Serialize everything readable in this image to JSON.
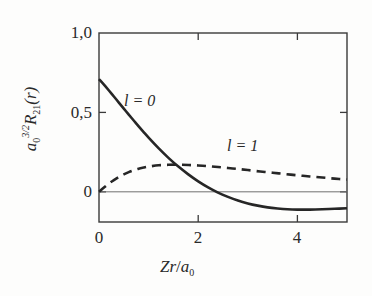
{
  "chart_data": {
    "type": "line",
    "title": "",
    "subtitle": "",
    "xlabel": "Zr/a0",
    "xlabel_parts": {
      "Z": "Z",
      "r": "r",
      "slash": "/",
      "a": "a",
      "sub": "0"
    },
    "ylabel": "a0^(3/2) R21(r)",
    "ylabel_parts": {
      "a": "a",
      "a_sub": "0",
      "a_sup": "3/2",
      "R": "R",
      "R_sub": "21",
      "arg": "(r)"
    },
    "xlim": [
      0,
      5
    ],
    "ylim": [
      -0.19,
      1.0
    ],
    "grid": false,
    "legend_position": "inline-annotations",
    "x_ticks": [
      {
        "value": 0,
        "label": "0"
      },
      {
        "value": 2,
        "label": "2"
      },
      {
        "value": 4,
        "label": "4"
      }
    ],
    "x_minor_ticks": [],
    "y_ticks": [
      {
        "value": 0,
        "label": "0"
      },
      {
        "value": 0.5,
        "label": "0,5"
      },
      {
        "value": 1.0,
        "label": "1,0"
      }
    ],
    "zero_line": {
      "value": 0,
      "visible": true
    },
    "annotations": [
      {
        "name": "l-equals-0",
        "text": "l = 0",
        "x": 0.5,
        "y": 0.64
      },
      {
        "name": "l-equals-1",
        "text": "l = 1",
        "x": 2.6,
        "y": 0.35
      }
    ],
    "series": [
      {
        "name": "l = 0",
        "label": "l = 0",
        "style": "solid",
        "color": "#262626",
        "width": 2.6,
        "x": [
          0.0,
          0.1,
          0.2,
          0.3,
          0.4,
          0.5,
          0.6,
          0.7,
          0.8,
          0.9,
          1.0,
          1.2,
          1.4,
          1.6,
          1.8,
          2.0,
          2.2,
          2.4,
          2.6,
          2.8,
          3.0,
          3.2,
          3.4,
          3.6,
          3.8,
          4.0,
          4.25,
          4.5,
          4.75,
          5.0
        ],
        "values": [
          0.71,
          0.675,
          0.638,
          0.6,
          0.562,
          0.524,
          0.486,
          0.449,
          0.412,
          0.376,
          0.341,
          0.275,
          0.214,
          0.159,
          0.11,
          0.066,
          0.028,
          -0.005,
          -0.032,
          -0.055,
          -0.073,
          -0.087,
          -0.098,
          -0.105,
          -0.11,
          -0.112,
          -0.112,
          -0.11,
          -0.107,
          -0.103
        ]
      },
      {
        "name": "l = 1",
        "label": "l = 1",
        "style": "dashed",
        "color": "#262626",
        "width": 2.6,
        "dash_pattern": "9,6",
        "x": [
          0.0,
          0.1,
          0.2,
          0.3,
          0.4,
          0.5,
          0.6,
          0.7,
          0.8,
          0.9,
          1.0,
          1.2,
          1.4,
          1.6,
          1.8,
          2.0,
          2.2,
          2.4,
          2.6,
          2.8,
          3.0,
          3.25,
          3.5,
          3.75,
          4.0,
          4.25,
          4.5,
          4.75,
          5.0
        ],
        "values": [
          0.0,
          0.027,
          0.052,
          0.074,
          0.093,
          0.11,
          0.124,
          0.136,
          0.146,
          0.153,
          0.159,
          0.167,
          0.17,
          0.171,
          0.169,
          0.166,
          0.162,
          0.156,
          0.15,
          0.144,
          0.137,
          0.128,
          0.12,
          0.112,
          0.104,
          0.097,
          0.09,
          0.083,
          0.077
        ]
      }
    ]
  },
  "figure": {
    "background_color": "#fdfdfc",
    "frame_color": "#3a3a3a",
    "text_color": "#2a2a2a"
  }
}
